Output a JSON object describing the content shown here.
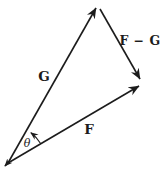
{
  "diagram": {
    "type": "vector-subtraction-triangle",
    "labels": {
      "g": "G",
      "f": "F",
      "f_minus_g": "F − G",
      "angle": "θ"
    },
    "colors": {
      "stroke": "#1c1c1c",
      "background": "#ffffff"
    }
  }
}
